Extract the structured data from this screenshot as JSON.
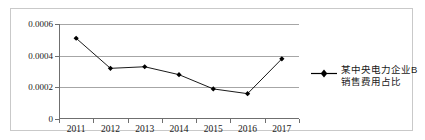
{
  "chart_data": {
    "type": "line",
    "title": "",
    "xlabel": "",
    "ylabel": "",
    "categories": [
      "2011",
      "2012",
      "2013",
      "2014",
      "2015",
      "2016",
      "2017"
    ],
    "series": [
      {
        "name": "某中央电力企业B销售费用占比",
        "values": [
          0.00051,
          0.00032,
          0.00033,
          0.00028,
          0.00019,
          0.00016,
          0.00038
        ],
        "color": "#000000",
        "marker": "diamond"
      }
    ],
    "ylim": [
      0,
      0.0006
    ],
    "ytick_labels": [
      "0.0006",
      "0.0004",
      "0.0002",
      "0"
    ],
    "ytick_values": [
      0.0006,
      0.0004,
      0.0002,
      0
    ],
    "grid": "horizontal",
    "grid_color": "#a6a6a6",
    "legend_position": "right",
    "legend_lines": [
      "某中央电力企业B",
      "销售费用占比"
    ]
  }
}
